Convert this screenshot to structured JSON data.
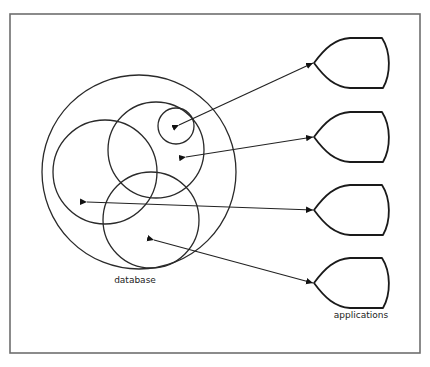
{
  "diagram": {
    "type": "database-to-applications",
    "labels": {
      "database": "database",
      "applications": "applications"
    },
    "colors": {
      "frame": "#6e6e6e",
      "lines": "#222222",
      "background": "#ffffff"
    },
    "database_circles": [
      {
        "name": "database-outer",
        "cx": 139,
        "cy": 172,
        "r": 97
      },
      {
        "name": "subset-left",
        "cx": 105,
        "cy": 172,
        "r": 52
      },
      {
        "name": "subset-upper-right",
        "cx": 156,
        "cy": 150,
        "r": 48
      },
      {
        "name": "subset-small",
        "cx": 176,
        "cy": 126,
        "r": 18
      },
      {
        "name": "subset-bottom",
        "cx": 151,
        "cy": 220,
        "r": 48
      }
    ],
    "applications": [
      {
        "name": "application-1",
        "tip_y": 63
      },
      {
        "name": "application-2",
        "tip_y": 137
      },
      {
        "name": "application-3",
        "tip_y": 210
      },
      {
        "name": "application-4",
        "tip_y": 283
      }
    ],
    "arrows": [
      {
        "from": "application-1",
        "to": "subset-small"
      },
      {
        "from": "application-2",
        "to": "subset-upper-right"
      },
      {
        "from": "application-3",
        "to": "subset-left"
      },
      {
        "from": "application-4",
        "to": "subset-bottom"
      }
    ]
  }
}
